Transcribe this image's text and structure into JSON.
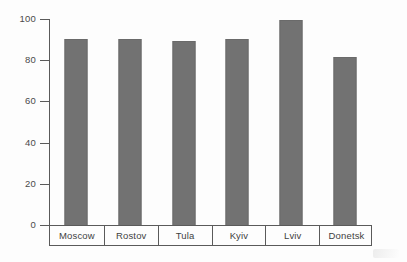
{
  "chart_data": {
    "type": "bar",
    "title": "",
    "xlabel": "",
    "ylabel": "",
    "categories": [
      "Moscow",
      "Rostov",
      "Tula",
      "Kyiv",
      "Lviv",
      "Donetsk"
    ],
    "values": [
      91,
      91,
      90,
      91,
      100,
      82
    ],
    "ylim": [
      0,
      100
    ],
    "yticks": [
      0,
      20,
      40,
      60,
      80,
      100
    ],
    "ytick_labels": [
      "0",
      "20",
      "40",
      "60",
      "80",
      "100"
    ],
    "grid": false,
    "legend": false,
    "orientation": "vertical",
    "series": [
      {
        "name": "",
        "values": [
          91,
          91,
          90,
          91,
          100,
          82
        ]
      }
    ]
  },
  "colors": {
    "bar_fill": "#727272",
    "bar_edge": "#6a6a6a",
    "axis": "#5a5a5a",
    "text": "#4a4a4a",
    "background": "#fdfdfd"
  }
}
